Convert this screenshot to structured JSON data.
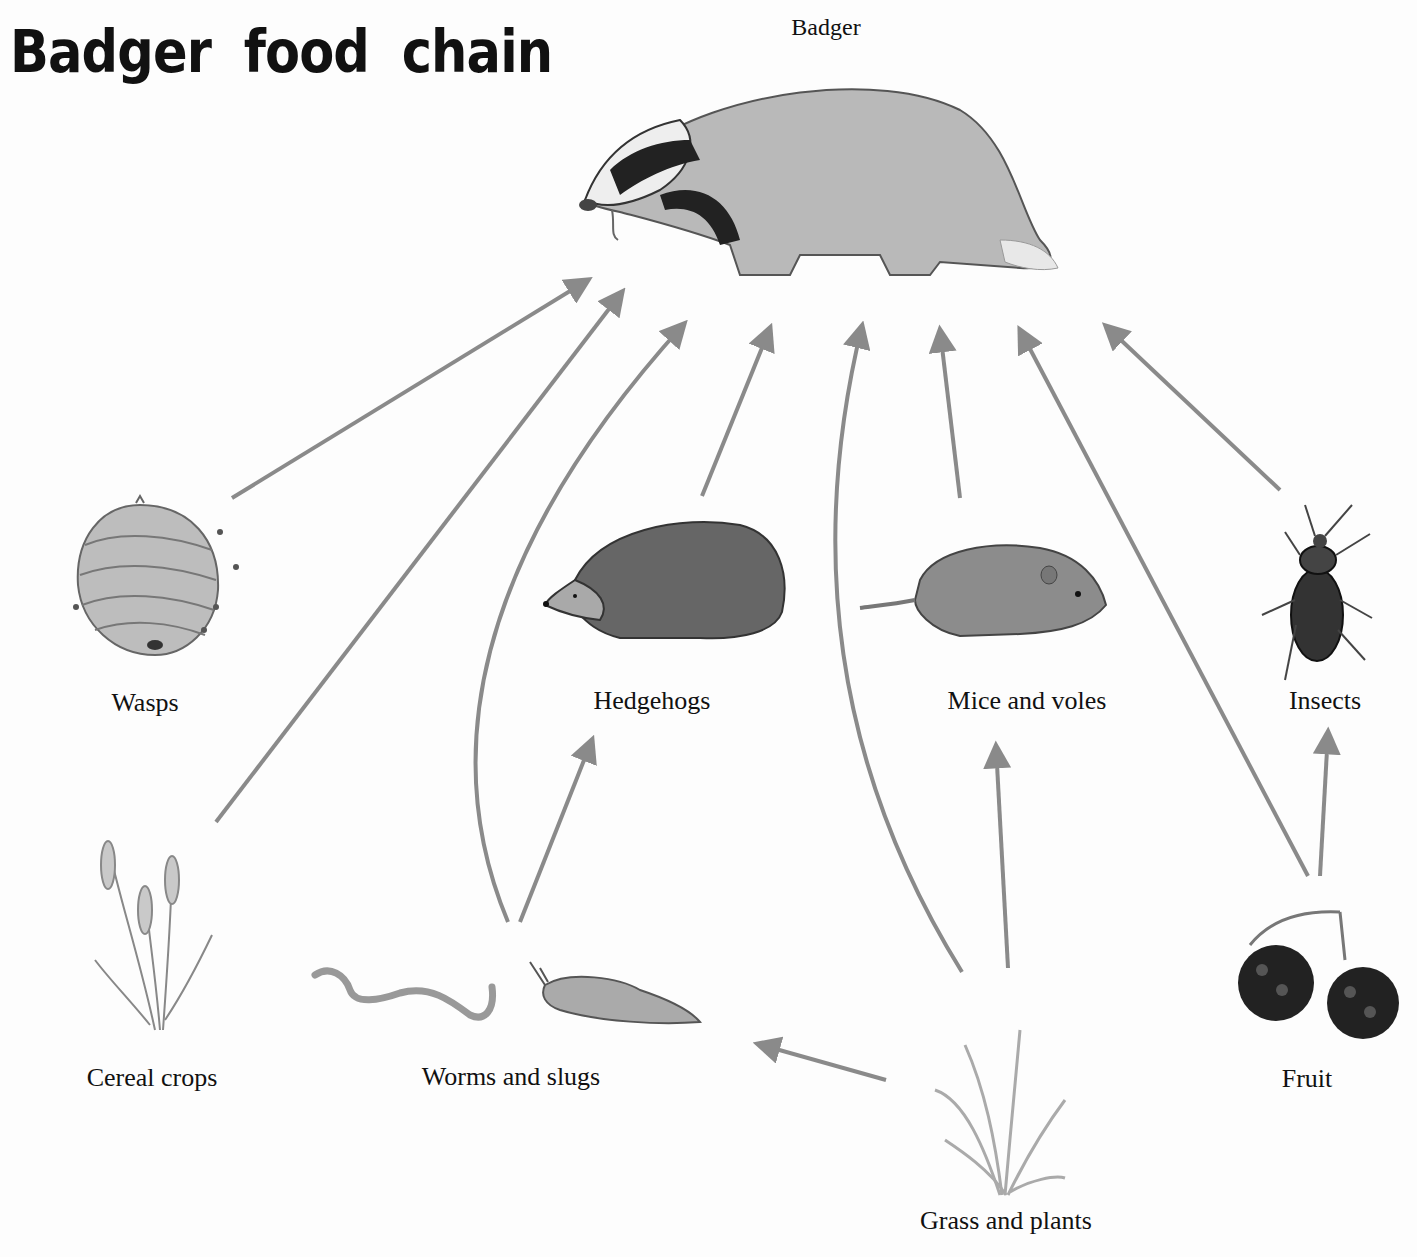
{
  "title": "Badger food chain",
  "nodes": {
    "badger": {
      "label": "Badger",
      "icon": "badger-illustration"
    },
    "wasps": {
      "label": "Wasps",
      "icon": "wasp-nest-illustration"
    },
    "hedgehogs": {
      "label": "Hedgehogs",
      "icon": "hedgehog-illustration"
    },
    "mice": {
      "label": "Mice and voles",
      "icon": "vole-illustration"
    },
    "insects": {
      "label": "Insects",
      "icon": "beetle-illustration"
    },
    "cereal": {
      "label": "Cereal crops",
      "icon": "wheat-illustration"
    },
    "worms": {
      "label": "Worms and slugs",
      "icon": "worm-slug-illustration"
    },
    "grass": {
      "label": "Grass and plants",
      "icon": "grass-illustration"
    },
    "fruit": {
      "label": "Fruit",
      "icon": "blackberry-illustration"
    }
  },
  "edges": [
    {
      "from": "Wasps",
      "to": "Badger"
    },
    {
      "from": "Cereal crops",
      "to": "Badger"
    },
    {
      "from": "Worms and slugs",
      "to": "Badger"
    },
    {
      "from": "Hedgehogs",
      "to": "Badger"
    },
    {
      "from": "Grass and plants",
      "to": "Badger"
    },
    {
      "from": "Mice and voles",
      "to": "Badger"
    },
    {
      "from": "Fruit",
      "to": "Badger"
    },
    {
      "from": "Insects",
      "to": "Badger"
    },
    {
      "from": "Worms and slugs",
      "to": "Hedgehogs"
    },
    {
      "from": "Grass and plants",
      "to": "Mice and voles"
    },
    {
      "from": "Grass and plants",
      "to": "Worms and slugs"
    },
    {
      "from": "Fruit",
      "to": "Insects"
    }
  ],
  "colors": {
    "arrow": "#8a8a8a",
    "text": "#111111",
    "background": "#fdfdfd"
  }
}
